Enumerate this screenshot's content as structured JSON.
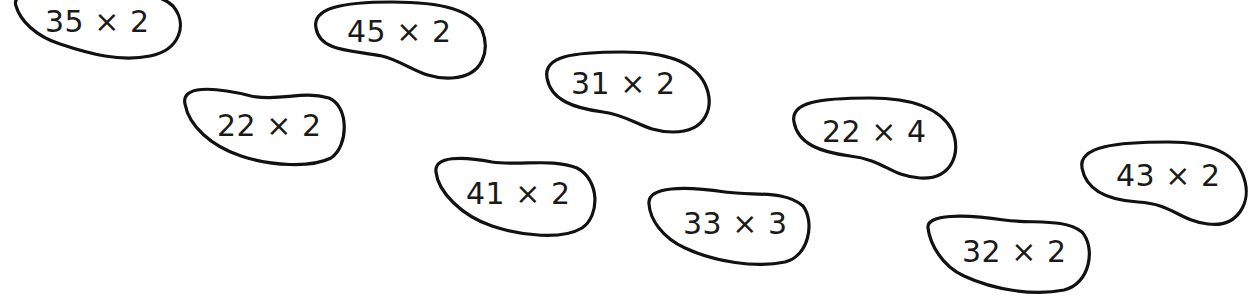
{
  "blobs": [
    {
      "id": "b1",
      "expression": "35 × 2"
    },
    {
      "id": "b2",
      "expression": "45 × 2"
    },
    {
      "id": "b3",
      "expression": "22 × 2"
    },
    {
      "id": "b4",
      "expression": "31 × 2"
    },
    {
      "id": "b5",
      "expression": "41 × 2"
    },
    {
      "id": "b6",
      "expression": "33 × 3"
    },
    {
      "id": "b7",
      "expression": "22 × 4"
    },
    {
      "id": "b8",
      "expression": "32 × 2"
    },
    {
      "id": "b9",
      "expression": "43 × 2"
    }
  ]
}
